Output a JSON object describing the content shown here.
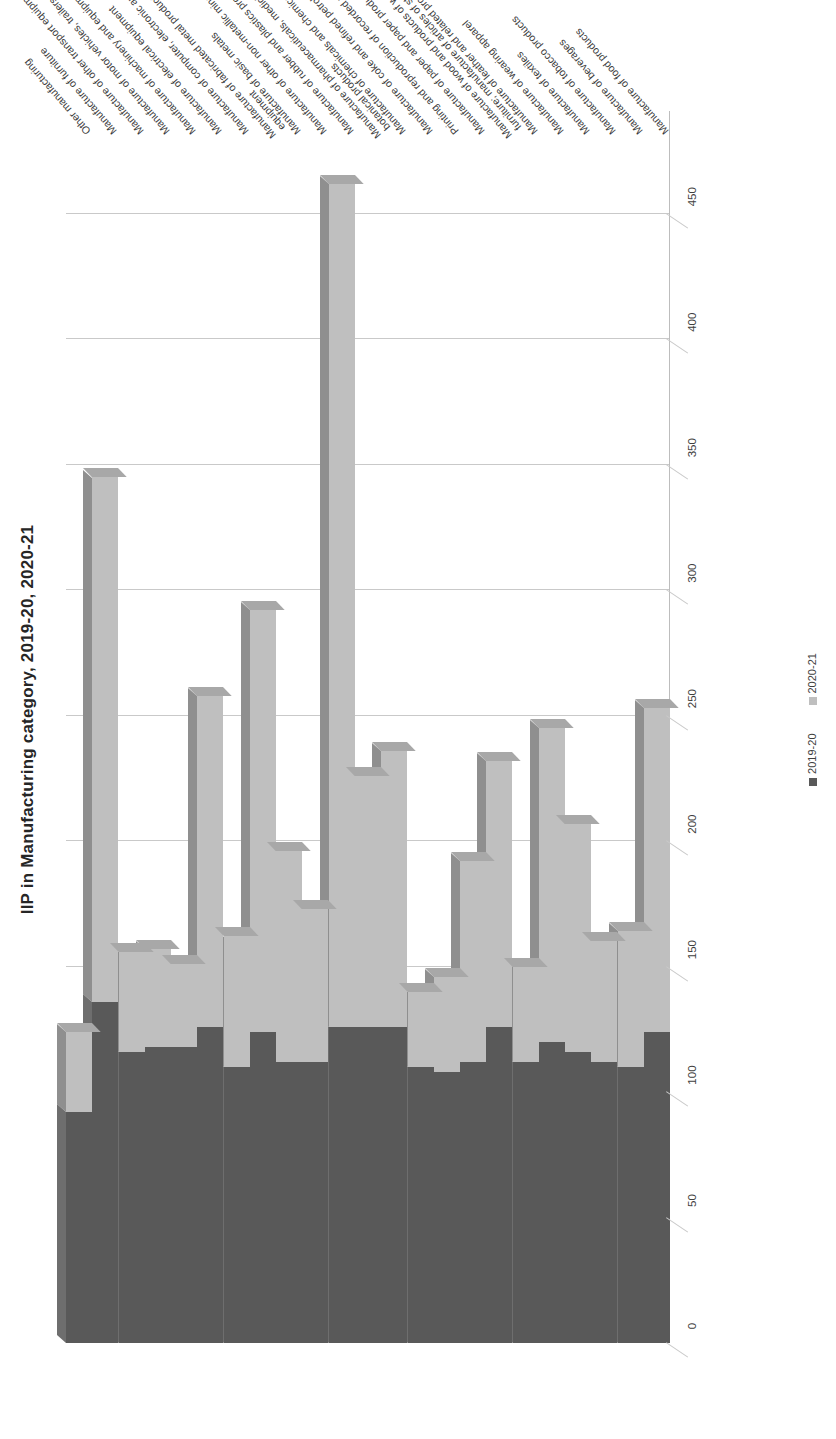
{
  "chart_data": {
    "type": "bar",
    "orientation": "horizontal",
    "stacked": false,
    "title": "IIP in Manufacturing category, 2019-20, 2020-21",
    "xlabel": "",
    "ylabel": "",
    "xlim": [
      0,
      475
    ],
    "xticks": [
      0,
      50,
      100,
      150,
      200,
      250,
      300,
      350,
      400,
      450
    ],
    "grid": true,
    "legend_position": "right",
    "categories": [
      "Manufacture of food products",
      "Manufacture of beverages",
      "Manufacture of tobacco products",
      "Manufacture of textiles",
      "Manufacture of wearing apparel",
      "Manufacture of leather and related products",
      "Manufacture of wood and products of wood and cork, except furniture; manufacture of articles of straw and plaiting materials",
      "Manufacture of paper and paper products",
      "Printing and reproduction of recorded media",
      "Manufacture of coke and refined petroleum products",
      "Manufacture of chemicals and chemical products",
      "Manufacture of pharmaceuticals, medicinal chemical and botanical products",
      "Manufacture of rubber and plastics products",
      "Manufacture of other non-metallic mineral products",
      "Manufacture of basic metals",
      "Manufacture of fabricated metal products, except machinery and equipment",
      "Manufacture of computer, electronic and optical products",
      "Manufacture of electrical equipment",
      "Manufacture of machinery and equipment, n.e.c.",
      "Manufacture of motor vehicles, trailers and semi-trailers",
      "Manufacture of other transport equipment",
      "Manufacture of furniture",
      "Other manufacturing"
    ],
    "series": [
      {
        "name": "2019-20",
        "color": "#595959",
        "values": [
          124,
          110,
          112,
          116,
          120,
          112,
          126,
          112,
          108,
          110,
          126,
          126,
          126,
          112,
          112,
          124,
          110,
          126,
          118,
          118,
          116,
          136,
          92
        ]
      },
      {
        "name": "2020-21",
        "color": "#bfbfbf",
        "values": [
          253,
          164,
          160,
          207,
          245,
          150,
          232,
          192,
          146,
          140,
          236,
          226,
          462,
          173,
          196,
          292,
          162,
          258,
          151,
          157,
          156,
          345,
          124
        ]
      }
    ]
  },
  "legend": {
    "items": [
      {
        "label": "2019-20",
        "color": "#595959"
      },
      {
        "label": "2020-21",
        "color": "#bfbfbf"
      }
    ]
  }
}
